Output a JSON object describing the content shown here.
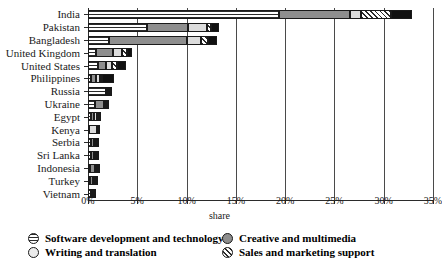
{
  "chart_data": {
    "type": "bar",
    "subtype": "stacked-horizontal-bar",
    "title": "",
    "xlabel": "share",
    "ylabel": "",
    "xlim": [
      0,
      35
    ],
    "xtick_labels": [
      "0%",
      "5%",
      "10%",
      "15%",
      "20%",
      "25%",
      "30%",
      "35%"
    ],
    "xtick_values": [
      0,
      5,
      10,
      15,
      20,
      25,
      30,
      35
    ],
    "grid": "vertical",
    "legend_position": "bottom",
    "categories": [
      "India",
      "Pakistan",
      "Bangladesh",
      "United Kingdom",
      "United States",
      "Philippines",
      "Russia",
      "Ukraine",
      "Egypt",
      "Kenya",
      "Serbia",
      "Sri Lanka",
      "Indonesia",
      "Turkey",
      "Vietnam"
    ],
    "series": [
      {
        "name": "Software development and technology",
        "key": "software",
        "pattern": "horizontal-stripes",
        "color": "#ffffff",
        "values": [
          19.4,
          6.0,
          2.1,
          0.8,
          1.0,
          0.35,
          1.85,
          0.7,
          0.35,
          0.1,
          0.35,
          0.3,
          0.2,
          0.2,
          0.3
        ]
      },
      {
        "name": "Creative and multimedia",
        "key": "creative",
        "pattern": "solid",
        "color": "#8e8e8e",
        "values": [
          7.2,
          4.1,
          7.9,
          1.7,
          0.8,
          0.5,
          0.15,
          0.9,
          0.3,
          0.05,
          0.25,
          0.35,
          0.5,
          0.35,
          0.15
        ]
      },
      {
        "name": "Writing and translation",
        "key": "writing",
        "pattern": "solid-light",
        "color": "#dcdcdc",
        "values": [
          1.1,
          2.0,
          1.5,
          0.9,
          0.6,
          0.35,
          0.15,
          0.2,
          0.3,
          0.75,
          0.25,
          0.2,
          0.2,
          0.15,
          0.1
        ]
      },
      {
        "name": "Sales and marketing support",
        "key": "sales",
        "pattern": "diagonal-hatch",
        "color": "#ffffff",
        "values": [
          3.0,
          0.35,
          0.7,
          0.55,
          0.55,
          0.25,
          0.1,
          0.1,
          0.15,
          0.1,
          0.1,
          0.1,
          0.1,
          0.1,
          0.1
        ]
      },
      {
        "name": "Other",
        "key": "other",
        "pattern": "solid-dark",
        "color": "#111111",
        "values": [
          2.2,
          0.85,
          0.9,
          0.5,
          0.95,
          1.15,
          0.1,
          0.1,
          0.1,
          0.05,
          0.1,
          0.1,
          0.1,
          0.1,
          0.1
        ]
      }
    ],
    "totals": [
      32.9,
      13.3,
      13.1,
      4.45,
      3.9,
      2.6,
      2.35,
      2.0,
      1.2,
      1.05,
      1.05,
      1.05,
      1.1,
      0.9,
      0.75
    ]
  },
  "axis": {
    "x_title": "share",
    "x_ticks": [
      "0%",
      "5%",
      "10%",
      "15%",
      "20%",
      "25%",
      "30%",
      "35%"
    ]
  },
  "legend": {
    "column1": [
      {
        "label": "Software development and technology",
        "key": "software"
      },
      {
        "label": "Writing and translation",
        "key": "writing"
      }
    ],
    "column2": [
      {
        "label": "Creative and multimedia",
        "key": "creative"
      },
      {
        "label": "Sales and marketing support",
        "key": "sales"
      }
    ]
  },
  "colors": {
    "creative": "#8e8e8e",
    "writing": "#dcdcdc",
    "other": "#111111",
    "axis": "#2b2b2b",
    "grid": "#4a4a4a"
  }
}
